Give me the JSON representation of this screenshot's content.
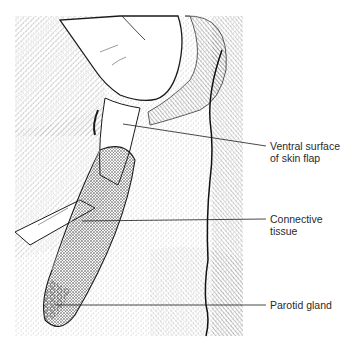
{
  "figure": {
    "type": "surgical illustration",
    "labels": [
      {
        "id": "ventral-surface",
        "line1": "Ventral surface",
        "line2": "of skin flap"
      },
      {
        "id": "connective-tissue",
        "line1": "Connective",
        "line2": "tissue"
      },
      {
        "id": "parotid-gland",
        "line1": "Parotid gland",
        "line2": ""
      }
    ]
  },
  "colors": {
    "ink": "#1a1a1a",
    "label_text": "#2a2a2a",
    "background": "#ffffff"
  }
}
